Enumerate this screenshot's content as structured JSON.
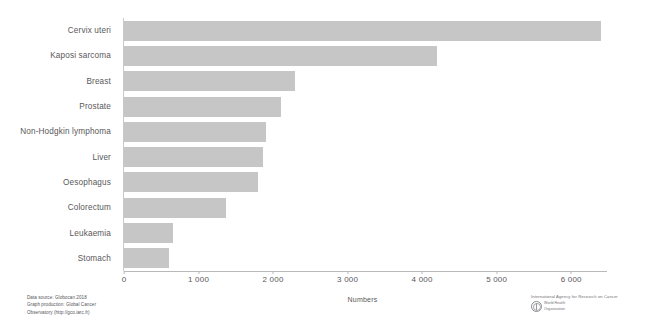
{
  "chart_data": {
    "type": "bar",
    "orientation": "horizontal",
    "title": "",
    "xlabel": "Numbers",
    "ylabel": "",
    "xlim": [
      0,
      6400
    ],
    "axis_max": 6400,
    "xticks": [
      0,
      1000,
      2000,
      3000,
      4000,
      5000,
      6000
    ],
    "xtick_labels": [
      "0",
      "1 000",
      "2 000",
      "3 000",
      "4 000",
      "5 000",
      "6 000"
    ],
    "grid": false,
    "legend": false,
    "bar_color": "#c6c6c6",
    "categories": [
      "Cervix uteri",
      "Kaposi sarcoma",
      "Breast",
      "Prostate",
      "Non-Hodgkin lymphoma",
      "Liver",
      "Oesophagus",
      "Colorectum",
      "Leukaemia",
      "Stomach"
    ],
    "values": [
      6400,
      4200,
      2300,
      2100,
      1900,
      1870,
      1800,
      1370,
      660,
      600
    ]
  },
  "footer": {
    "source_lines": [
      "Data source: Globocan 2018",
      "Graph production: Global Cancer",
      "Observatory (http://gco.iarc.fr)"
    ],
    "agency": "International Agency for Research on Cancer",
    "who_lines": [
      "World Health",
      "Organization"
    ]
  }
}
